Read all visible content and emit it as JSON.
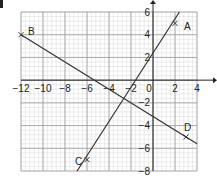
{
  "question_marker": "",
  "chart_data": {
    "type": "line",
    "title": "",
    "xlabel": "",
    "ylabel": "",
    "xlim": [
      -12,
      4
    ],
    "ylim": [
      -8,
      6
    ],
    "grid": true,
    "minor_grid": true,
    "x_ticks": [
      -12,
      -10,
      -8,
      -6,
      -4,
      -2,
      0,
      2,
      4
    ],
    "y_ticks": [
      6,
      4,
      2,
      -2,
      -4,
      -6,
      -8
    ],
    "x_tick_labels": [
      "−12",
      "−10",
      "−8",
      "−6",
      "−4",
      "−2",
      "0",
      "2",
      "4"
    ],
    "y_tick_labels": [
      "6",
      "4",
      "2",
      "−2",
      "−4",
      "−6",
      "−8"
    ],
    "points": [
      {
        "label": "A",
        "x": 2,
        "y": 5
      },
      {
        "label": "B",
        "x": -12,
        "y": 4
      },
      {
        "label": "C",
        "x": -6,
        "y": -7
      },
      {
        "label": "D",
        "x": 3,
        "y": -5
      }
    ],
    "series": [
      {
        "name": "Line AC",
        "through": [
          "C",
          "A"
        ],
        "equation": "y = 2x + 2",
        "x": [
          -6.9,
          2.4
        ],
        "y": [
          -8,
          6
        ]
      },
      {
        "name": "Line BD",
        "through": [
          "B",
          "D"
        ],
        "equation": "y = -0.6x - 3.2",
        "x": [
          -12,
          4
        ],
        "y": [
          4,
          -5.6
        ]
      }
    ],
    "colors": {
      "line": "#333333",
      "grid_major": "#9a9a9a",
      "grid_minor": "#d8d8d8",
      "axis": "#222222"
    }
  }
}
